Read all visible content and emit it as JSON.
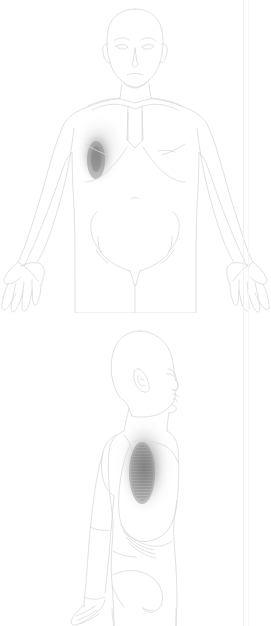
{
  "chart": {
    "background_color": "#ffffff",
    "width": 271,
    "height": 626,
    "outline_color": "#d8d8dc",
    "detail_color": "#e2e2e6",
    "pain_color_core": "#8f8f8f",
    "pain_color_mid": "#b4b4b4",
    "pain_color_edge": "#ededed",
    "edge_rule_color": "#f1f1f3"
  },
  "views": [
    {
      "id": "anterior",
      "label": "Anterior view",
      "orientation": "front",
      "figure": "adult male, bald, arms abducted, palms forward",
      "parts": [
        "head",
        "face",
        "eyes",
        "eyebrows",
        "nose",
        "mouth",
        "ears",
        "neck",
        "clavicles",
        "sternum",
        "shoulders",
        "pectorals",
        "costal-margin",
        "abdomen",
        "navel",
        "iliac-crests",
        "groin",
        "arms",
        "elbows",
        "forearms",
        "hands",
        "fingers",
        "thighs"
      ],
      "pain_region": {
        "name": "right-anterior-chest-axilla",
        "label": "Right anterior chest / axilla",
        "side": "right",
        "center_x": 98,
        "center_y": 155,
        "radius_x": 22,
        "radius_y": 33,
        "intensity": "high"
      }
    },
    {
      "id": "lateral",
      "label": "Lateral view",
      "orientation": "right side, facing right",
      "figure": "adult male, bald, arm at side",
      "parts": [
        "head-profile",
        "ear",
        "nose",
        "lips",
        "chin",
        "neck",
        "shoulder",
        "upper-arm",
        "forearm",
        "hand",
        "thorax",
        "lateral-ribs",
        "costal-margin",
        "abdomen",
        "buttock",
        "hip",
        "thigh"
      ],
      "pain_region": {
        "name": "right-lateral-ribs",
        "label": "Right lateral rib cage",
        "side": "right",
        "center_x": 143,
        "center_y": 468,
        "radius_x": 23,
        "radius_y": 42,
        "intensity": "high",
        "hatching": "horizontal"
      }
    }
  ]
}
